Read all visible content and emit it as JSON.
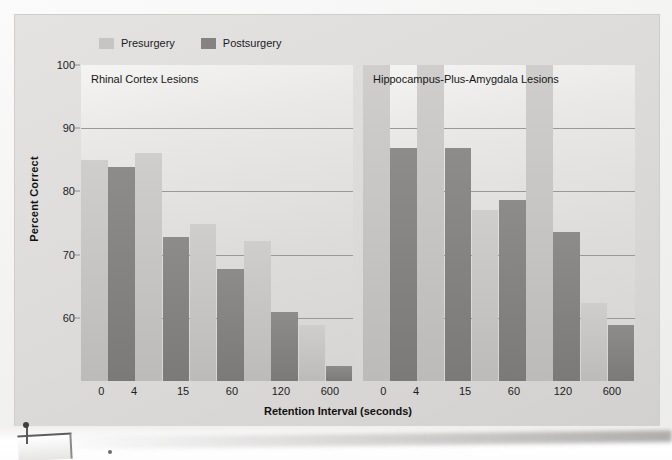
{
  "figure": {
    "legend": {
      "entries": [
        {
          "label": "Presurgery",
          "color": "#c6c5c4",
          "icon": "legend-swatch"
        },
        {
          "label": "Postsurgery",
          "color": "#848382",
          "icon": "legend-swatch"
        }
      ]
    },
    "ylabel": "Percent Correct",
    "xlabel": "Retention Interval (seconds)",
    "panels": [
      {
        "title": "Rhinal Cortex Lesions"
      },
      {
        "title": "Hippocampus-Plus-Amygdala Lesions"
      }
    ]
  },
  "chart_data": {
    "type": "bar",
    "title": "",
    "xlabel": "Retention Interval (seconds)",
    "ylabel": "Percent Correct",
    "ylim": [
      50,
      100
    ],
    "yticks": [
      60,
      70,
      80,
      90,
      100
    ],
    "grid": true,
    "legend_position": "top-left",
    "categories": [
      "0",
      "4",
      "15",
      "60",
      "120",
      "600"
    ],
    "panels": [
      {
        "title": "Rhinal Cortex Lesions",
        "series": [
          {
            "name": "Presurgery",
            "color": "#c6c5c4",
            "values": [
              85.0,
              86.0,
              74.8,
              72.2,
              58.9,
              null
            ]
          },
          {
            "name": "Postsurgery",
            "color": "#848382",
            "values": [
              83.9,
              72.8,
              67.8,
              60.9,
              52.4,
              null
            ]
          }
        ],
        "note": "Bars are drawn as 5 adjacent pre/post pairs spanning tick labels 0-600"
      },
      {
        "title": "Hippocampus-Plus-Amygdala Lesions",
        "series": [
          {
            "name": "Presurgery",
            "color": "#c6c5c4",
            "values": [
              null,
              null,
              77.0,
              73.5,
              62.4,
              null
            ]
          },
          {
            "name": "Postsurgery",
            "color": "#848382",
            "values": [
              86.8,
              86.8,
              78.7,
              73.5,
              58.9,
              null
            ]
          }
        ],
        "note": "First two pre-surgery bars exceed plotted top and read ~100; drawn clipped at axis max"
      }
    ],
    "panel_left_bars": [
      {
        "series": "Presurgery",
        "value": 85.0
      },
      {
        "series": "Postsurgery",
        "value": 83.9
      },
      {
        "series": "Presurgery",
        "value": 86.0
      },
      {
        "series": "Postsurgery",
        "value": 72.8
      },
      {
        "series": "Presurgery",
        "value": 74.8
      },
      {
        "series": "Postsurgery",
        "value": 67.8
      },
      {
        "series": "Presurgery",
        "value": 72.2
      },
      {
        "series": "Postsurgery",
        "value": 60.9
      },
      {
        "series": "Presurgery",
        "value": 58.9
      },
      {
        "series": "Postsurgery",
        "value": 52.4
      }
    ],
    "panel_right_bars": [
      {
        "series": "Presurgery",
        "value": 100.0
      },
      {
        "series": "Postsurgery",
        "value": 86.8
      },
      {
        "series": "Presurgery",
        "value": 100.0
      },
      {
        "series": "Postsurgery",
        "value": 86.8
      },
      {
        "series": "Presurgery",
        "value": 77.0
      },
      {
        "series": "Postsurgery",
        "value": 78.7
      },
      {
        "series": "Presurgery",
        "value": 100.0
      },
      {
        "series": "Postsurgery",
        "value": 73.5
      },
      {
        "series": "Presurgery",
        "value": 62.4
      },
      {
        "series": "Postsurgery",
        "value": 58.9
      }
    ],
    "xtick_labels": [
      "0",
      "4",
      "15",
      "60",
      "120",
      "600"
    ]
  }
}
